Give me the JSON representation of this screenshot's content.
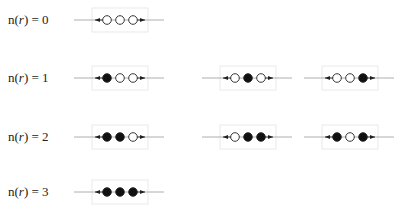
{
  "colors": {
    "filled": "#111111",
    "empty": "#ffffff",
    "stroke": "#222222",
    "line": "#9a9a9a",
    "box": "#e4e4e4"
  },
  "rows": [
    {
      "label_prefix": "n(",
      "label_var": "r",
      "label_suffix": ") = 0",
      "configs": [
        {
          "sites": [
            0,
            0,
            0
          ]
        }
      ]
    },
    {
      "label_prefix": "n(",
      "label_var": "r",
      "label_suffix": ") = 1",
      "configs": [
        {
          "sites": [
            1,
            0,
            0
          ]
        },
        {
          "sites": [
            0,
            1,
            0
          ]
        },
        {
          "sites": [
            0,
            0,
            1
          ]
        }
      ]
    },
    {
      "label_prefix": "n(",
      "label_var": "r",
      "label_suffix": ") = 2",
      "configs": [
        {
          "sites": [
            1,
            1,
            0
          ]
        },
        {
          "sites": [
            0,
            1,
            1
          ]
        },
        {
          "sites": [
            1,
            0,
            1
          ]
        }
      ]
    },
    {
      "label_prefix": "n(",
      "label_var": "r",
      "label_suffix": ") = 3",
      "configs": [
        {
          "sites": [
            1,
            1,
            1
          ]
        }
      ]
    }
  ]
}
